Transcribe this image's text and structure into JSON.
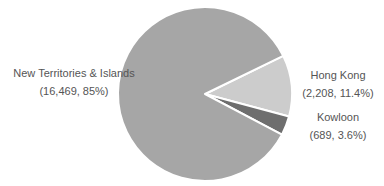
{
  "chart_data": {
    "type": "pie",
    "title": "",
    "categories": [
      "New Territories & Islands",
      "Hong Kong",
      "Kowloon"
    ],
    "values": [
      16469,
      2208,
      689
    ],
    "percentages": [
      85,
      11.4,
      3.6
    ],
    "colors": [
      "#a6a6a6",
      "#cccccc",
      "#6e6e6e"
    ],
    "legend": "none (direct labels)"
  },
  "labels": [
    {
      "name": "New Territories & Islands",
      "detail": "(16,469, 85%)"
    },
    {
      "name": "Hong Kong",
      "detail": "(2,208, 11.4%)"
    },
    {
      "name": "Kowloon",
      "detail": "(689, 3.6%)"
    }
  ]
}
